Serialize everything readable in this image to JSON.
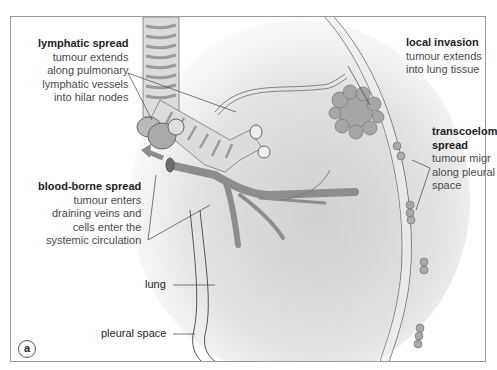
{
  "figure": {
    "panel_letter": "a",
    "annotations": {
      "lymphatic": {
        "title": "lymphatic spread",
        "lines": [
          "tumour extends",
          "along pulmonary",
          "lymphatic vessels",
          "into hilar nodes"
        ]
      },
      "local": {
        "title": "local invasion",
        "lines": [
          "tumour extends",
          "into lung tissue"
        ]
      },
      "transcoelomic": {
        "title_line1": "transcoelom",
        "title_line2": "spread",
        "lines": [
          "tumour migr",
          "along pleural",
          "space"
        ]
      },
      "blood": {
        "title": "blood-borne spread",
        "lines": [
          "tumour enters",
          "draining veins and",
          "cells enter the",
          "systemic circulation"
        ]
      }
    },
    "structure_labels": {
      "lung": "lung",
      "pleural_space": "pleural space"
    },
    "colors": {
      "tissue_fill": "#c8c8c8",
      "tissue_dark": "#9b9b9b",
      "outline": "#555555",
      "shadow": "#d4d4d4",
      "text": "#4a4a4a",
      "title": "#1e1e1e"
    }
  }
}
